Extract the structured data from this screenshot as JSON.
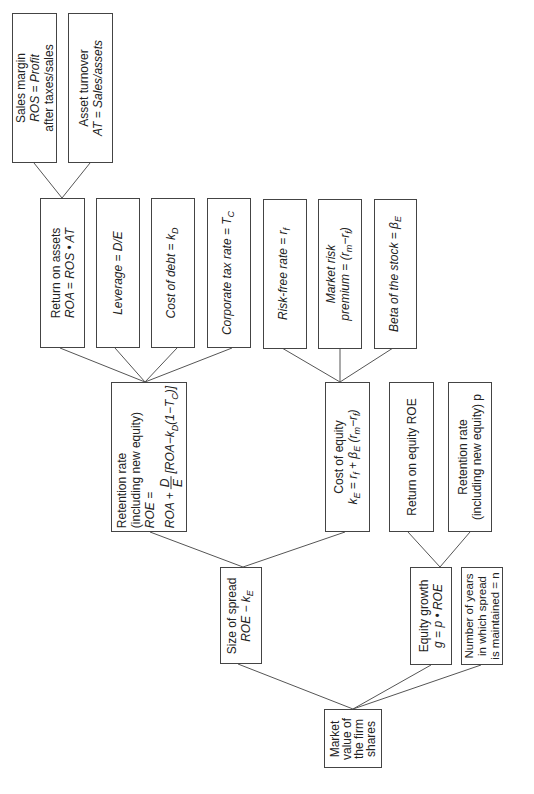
{
  "diagram": {
    "level1": [
      {
        "id": "sales-margin",
        "lines": [
          "Sales margin",
          "ROS = Profit",
          "after taxes/sales"
        ]
      },
      {
        "id": "asset-turnover",
        "lines": [
          "Asset turnover",
          "AT = Sales/assets"
        ]
      }
    ],
    "level2": [
      {
        "id": "return-on-assets",
        "lines": [
          "Return on assets",
          "ROA = ROS • AT"
        ]
      },
      {
        "id": "leverage",
        "lines": [
          "Leverage = D/E"
        ]
      },
      {
        "id": "cost-of-debt",
        "lines": [
          "Cost of debt = k",
          "D"
        ]
      },
      {
        "id": "corporate-tax-rate",
        "lines": [
          "Corporate tax rate = T",
          "C"
        ]
      },
      {
        "id": "risk-free-rate",
        "lines": [
          "Risk-free rate = r",
          "f"
        ]
      },
      {
        "id": "market-risk-premium",
        "lines": [
          "Market risk",
          "premium = (r",
          "m",
          "−r",
          "f",
          ")"
        ]
      },
      {
        "id": "beta",
        "lines": [
          "Beta of the stock = β",
          "E"
        ]
      }
    ],
    "level3": [
      {
        "id": "roe-formula",
        "lines": [
          "Retention rate",
          "(including new equity)",
          "ROE =",
          "ROA +",
          "D",
          "E",
          "[ROA−k",
          "D",
          "(1−T",
          "C",
          ")]"
        ]
      },
      {
        "id": "cost-of-equity",
        "lines": [
          "Cost of equity",
          "k",
          "E",
          " = r",
          "f",
          " + β",
          "E",
          " (r",
          "m",
          "−r",
          "f",
          ")"
        ]
      },
      {
        "id": "return-on-equity",
        "lines": [
          "Return on equity ROE"
        ]
      },
      {
        "id": "retention-rate",
        "lines": [
          "Retention rate",
          "(including new equity) p"
        ]
      }
    ],
    "level4": [
      {
        "id": "size-of-spread",
        "lines": [
          "Size of spread",
          "ROE − k",
          "E"
        ]
      },
      {
        "id": "equity-growth",
        "lines": [
          "Equity growth",
          "g = p • ROE"
        ]
      },
      {
        "id": "years-maintained",
        "lines": [
          "Number of years",
          "in which spread",
          "is maintained = n"
        ]
      }
    ],
    "root": {
      "id": "market-value",
      "lines": [
        "Market",
        "value of",
        "the firm",
        "shares"
      ]
    }
  }
}
